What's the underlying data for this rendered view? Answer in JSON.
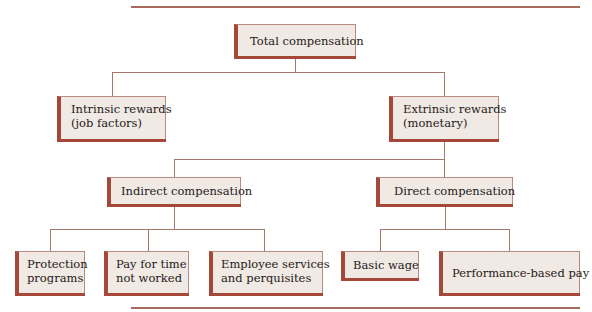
{
  "diagram": {
    "root": {
      "label": "Total compensation"
    },
    "level1": [
      {
        "label_line1": "Intrinsic rewards",
        "label_line2": "(job factors)"
      },
      {
        "label_line1": "Extrinsic rewards",
        "label_line2": "(monetary)"
      }
    ],
    "level2": [
      {
        "label": "Indirect compensation"
      },
      {
        "label": "Direct compensation"
      }
    ],
    "indirect_children": [
      {
        "label_line1": "Protection",
        "label_line2": "programs"
      },
      {
        "label_line1": "Pay for time",
        "label_line2": "not worked"
      },
      {
        "label_line1": "Employee services",
        "label_line2": "and perquisites"
      }
    ],
    "direct_children": [
      {
        "label": "Basic wage"
      },
      {
        "label": "Performance-based pay"
      }
    ],
    "colors": {
      "box_fill": "#f1e9e4",
      "box_accent": "#a5483a",
      "connector": "#a6786c",
      "rule": "#a86a5c"
    }
  }
}
